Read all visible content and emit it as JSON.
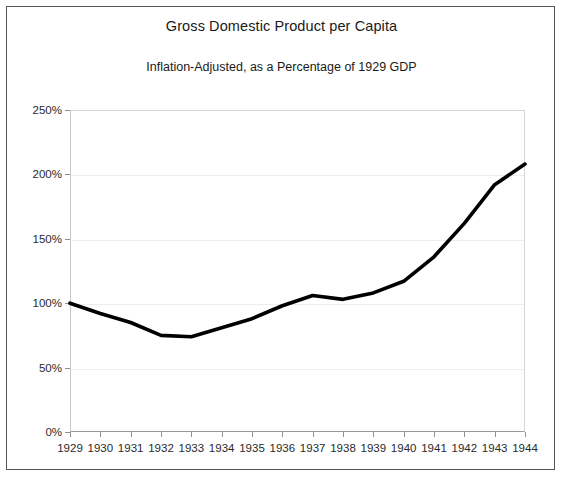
{
  "chart_data": {
    "type": "line",
    "title": "Gross Domestic Product per Capita",
    "subtitle": "Inflation-Adjusted, as a Percentage of 1929 GDP",
    "xlabel": "",
    "ylabel": "",
    "x": [
      1929,
      1930,
      1931,
      1932,
      1933,
      1934,
      1935,
      1936,
      1937,
      1938,
      1939,
      1940,
      1941,
      1942,
      1943,
      1944
    ],
    "categories": [
      "1929",
      "1930",
      "1931",
      "1932",
      "1933",
      "1934",
      "1935",
      "1936",
      "1937",
      "1938",
      "1939",
      "1940",
      "1941",
      "1942",
      "1943",
      "1944"
    ],
    "series": [
      {
        "name": "GDP per Capita",
        "values": [
          100,
          92,
          85,
          75,
          74,
          81,
          88,
          98,
          106,
          103,
          108,
          117,
          136,
          162,
          192,
          208
        ],
        "color": "#000000",
        "line_width": 3.6
      }
    ],
    "ylim": [
      0,
      250
    ],
    "xlim": [
      1929,
      1944
    ],
    "yticks": [
      0,
      50,
      100,
      150,
      200,
      250
    ],
    "ytick_labels": [
      "0%",
      "50%",
      "100%",
      "150%",
      "200%",
      "250%"
    ],
    "grid": true,
    "grid_axis": "y",
    "legend": false,
    "legend_position": "none",
    "units": "percent of 1929 GDP"
  },
  "figure": {
    "background_color": "#ffffff",
    "border_color": "#555555",
    "gridline_color": "#ededed",
    "axis_color": "#9a9a9a",
    "text_color": "#1a1a1a"
  }
}
